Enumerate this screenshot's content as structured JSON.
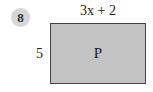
{
  "problem": {
    "number": "8",
    "top_side_label": "3x + 2",
    "left_side_label": "5",
    "shape_label": "P",
    "colors": {
      "badge": "#d6d6d6",
      "rectangle_fill": "#c3c3c3",
      "rectangle_border": "#444444"
    }
  }
}
